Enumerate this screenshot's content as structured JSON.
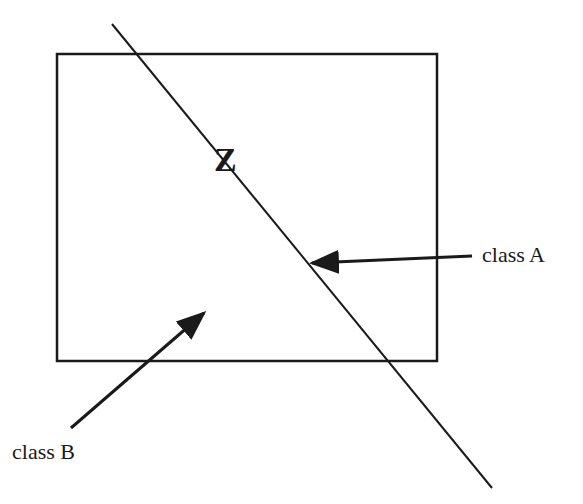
{
  "diagram": {
    "colors": {
      "stroke": "#1a1a1a",
      "background": "#ffffff"
    },
    "labels": {
      "hyperplane": "Z",
      "class_a": "class A",
      "class_b": "class B"
    },
    "rectangle": {
      "x": 57,
      "y": 54,
      "width": 380,
      "height": 307
    },
    "separating_line": {
      "x1": 112,
      "y1": 24,
      "x2": 492,
      "y2": 488
    },
    "arrow_a": {
      "from": [
        472,
        256
      ],
      "to": [
        307,
        263
      ]
    },
    "arrow_b": {
      "from": [
        71,
        428
      ],
      "to": [
        208,
        310
      ]
    }
  }
}
